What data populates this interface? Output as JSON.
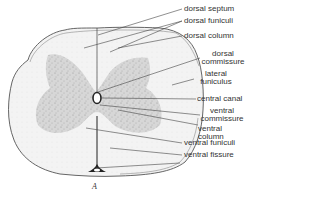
{
  "figure": {
    "caption": "A",
    "labels": [
      {
        "id": "dorsal-septum",
        "text": "dorsal septum"
      },
      {
        "id": "dorsal-funiculi",
        "text": "dorsal funiculi"
      },
      {
        "id": "dorsal-column",
        "text": "dorsal column"
      },
      {
        "id": "dorsal-commissure",
        "line1": "dorsal",
        "line2": "commissure"
      },
      {
        "id": "lateral-funiculus",
        "line1": "lateral",
        "line2": "funiculus"
      },
      {
        "id": "central-canal",
        "text": "central canal"
      },
      {
        "id": "ventral-commissure",
        "line1": "ventral",
        "line2": "commissure"
      },
      {
        "id": "ventral-column",
        "line1": "ventral",
        "line2": "column"
      },
      {
        "id": "ventral-funiculi",
        "text": "ventral funiculi"
      },
      {
        "id": "ventral-fissure",
        "text": "ventral fissure"
      }
    ],
    "colors": {
      "outline": "#555555",
      "gray_matter": "#cfcfcf",
      "white_matter": "#f2f2f2",
      "leader_line": "#444444",
      "text": "#333333"
    }
  }
}
